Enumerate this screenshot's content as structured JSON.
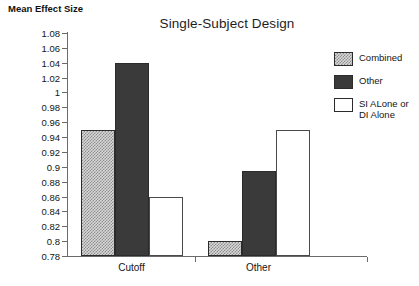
{
  "chart_data": {
    "type": "bar",
    "title": "Single-Subject Design",
    "xlabel": "",
    "ylabel": "Mean Effect Size",
    "ylim": [
      0.78,
      1.08
    ],
    "ytick_step": 0.02,
    "yticks": [
      "1.08",
      "1.06",
      "1.04",
      "1.02",
      "1",
      "0.98",
      "0.96",
      "0.94",
      "0.92",
      "0.9",
      "0.88",
      "0.86",
      "0.84",
      "0.82",
      "0.8",
      "0.78"
    ],
    "categories": [
      "Cutoff",
      "Other"
    ],
    "grid": false,
    "legend_position": "right",
    "series": [
      {
        "name": "Combined",
        "values": [
          0.95,
          0.8
        ],
        "fill": "checkerboard",
        "color": "#d8d8d8"
      },
      {
        "name": "Other",
        "values": [
          1.04,
          0.895
        ],
        "fill": "solid",
        "color": "#3a3a3a"
      },
      {
        "name": "SI ALone or DI Alone",
        "values": [
          0.86,
          0.95
        ],
        "fill": "none",
        "color": "#ffffff"
      }
    ]
  },
  "legend": {
    "items": [
      {
        "label": "Combined"
      },
      {
        "label": "Other"
      },
      {
        "label": "SI ALone or DI Alone"
      }
    ]
  }
}
